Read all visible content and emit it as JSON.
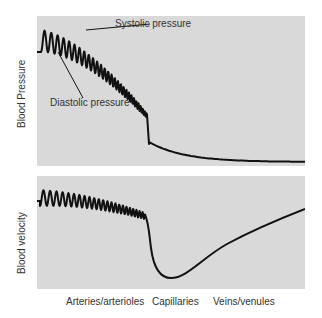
{
  "figure": {
    "top_panel": {
      "ylabel": "Blood Pressure",
      "annotations": [
        {
          "label": "Systolic pressure"
        },
        {
          "label": "Diastolic pressure"
        }
      ]
    },
    "bottom_panel": {
      "ylabel": "Blood velocity"
    },
    "x_categories": [
      "Arteries/arterioles",
      "Capillaries",
      "Veins/venules"
    ]
  },
  "colors": {
    "panel_bg": "#d9d9d9",
    "line": "#111111",
    "text": "#333333"
  }
}
